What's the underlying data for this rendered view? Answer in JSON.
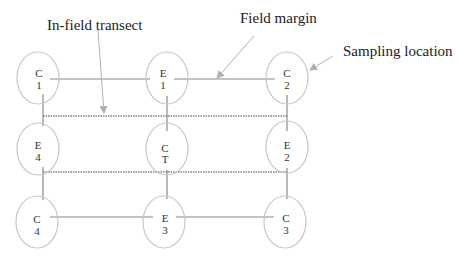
{
  "labels": {
    "in_field_transect": "In-field transect",
    "field_margin": "Field margin",
    "sampling_location": "Sampling location"
  },
  "nodes": [
    {
      "id": "C1",
      "line1": "C",
      "line2": "1",
      "cx": 38,
      "cy": 78
    },
    {
      "id": "E1",
      "line1": "E",
      "line2": "1",
      "cx": 167,
      "cy": 78
    },
    {
      "id": "C2",
      "line1": "C",
      "line2": "2",
      "cx": 287,
      "cy": 78
    },
    {
      "id": "E4",
      "line1": "E",
      "line2": "4",
      "cx": 38,
      "cy": 150
    },
    {
      "id": "CT",
      "line1": "C",
      "line2": "T",
      "cx": 167,
      "cy": 150
    },
    {
      "id": "E2",
      "line1": "E",
      "line2": "2",
      "cx": 287,
      "cy": 150
    },
    {
      "id": "C4",
      "line1": "C",
      "line2": "4",
      "cx": 38,
      "cy": 222
    },
    {
      "id": "E3",
      "line1": "E",
      "line2": "3",
      "cx": 167,
      "cy": 222
    },
    {
      "id": "C3",
      "line1": "C",
      "line2": "3",
      "cx": 287,
      "cy": 222
    }
  ],
  "colors": {
    "ellipse": "#c8c8c8",
    "line": "#8a8a8a",
    "dotted": "#444444",
    "arrow": "#b0b0b0",
    "text": "#222222"
  }
}
